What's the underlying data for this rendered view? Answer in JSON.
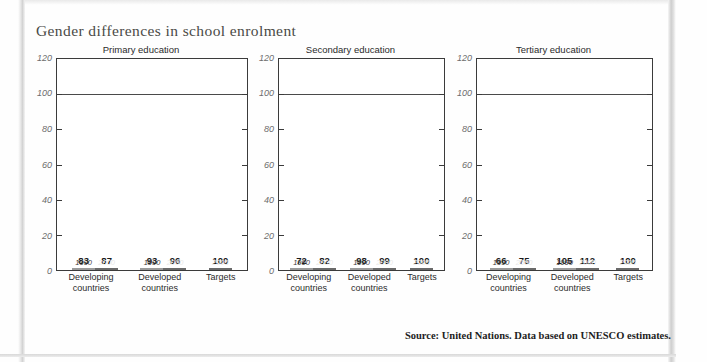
{
  "title": "Gender differences in school enrolment",
  "source": "Source: United Nations. Data based on UNESCO estimates.",
  "colors": {
    "bar_light": "#c3c3c3",
    "bar_dark": "#8c8c8c",
    "axis": "#3b3b3b",
    "title_text": "#4a4a46"
  },
  "axis": {
    "ticks": [
      "120",
      "100",
      "80",
      "60",
      "40",
      "20",
      "0"
    ],
    "ymin": 0,
    "ymax": 120
  },
  "groups": [
    {
      "line1": "Developing",
      "line2": "countries"
    },
    {
      "line1": "Developed",
      "line2": "countries"
    },
    {
      "line1": "Targets",
      "line2": ""
    }
  ],
  "years": {
    "a": "1990",
    "b": "2000",
    "target": "2005"
  },
  "chart_data": [
    {
      "type": "bar",
      "title": "Primary education",
      "xlabel": "",
      "ylabel": "",
      "ylim": [
        0,
        120
      ],
      "grid": true,
      "categories": [
        "Developing countries 1990",
        "Developing countries 2000",
        "Developed countries 1990",
        "Developed countries 2000",
        "Targets 2005"
      ],
      "values": [
        83,
        87,
        93,
        96,
        100
      ],
      "series": [
        {
          "name": "1990",
          "values": [
            83,
            93
          ]
        },
        {
          "name": "2000",
          "values": [
            87,
            96
          ]
        },
        {
          "name": "2005 target",
          "values": [
            100
          ]
        }
      ]
    },
    {
      "type": "bar",
      "title": "Secondary education",
      "xlabel": "",
      "ylabel": "",
      "ylim": [
        0,
        120
      ],
      "grid": true,
      "categories": [
        "Developing countries 1990",
        "Developing countries 2000",
        "Developed countries 1990",
        "Developed countries 2000",
        "Targets 2005"
      ],
      "values": [
        72,
        82,
        98,
        99,
        100
      ],
      "series": [
        {
          "name": "1990",
          "values": [
            72,
            98
          ]
        },
        {
          "name": "2000",
          "values": [
            82,
            99
          ]
        },
        {
          "name": "2005 target",
          "values": [
            100
          ]
        }
      ]
    },
    {
      "type": "bar",
      "title": "Tertiary education",
      "xlabel": "",
      "ylabel": "",
      "ylim": [
        0,
        120
      ],
      "grid": true,
      "categories": [
        "Developing countries 1990",
        "Developing countries 2000",
        "Developed countries 1990",
        "Developed countries 2000",
        "Targets 2005"
      ],
      "values": [
        66,
        75,
        105,
        112,
        100
      ],
      "series": [
        {
          "name": "1990",
          "values": [
            66,
            105
          ]
        },
        {
          "name": "2000",
          "values": [
            75,
            112
          ]
        },
        {
          "name": "2005 target",
          "values": [
            100
          ]
        }
      ]
    }
  ]
}
